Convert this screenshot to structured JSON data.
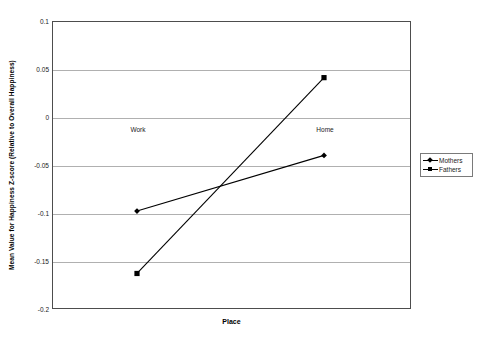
{
  "chart_data": {
    "type": "line",
    "title": "",
    "subtitle": "",
    "xlabel": "Place",
    "ylabel": "Mean Value for Happiness Z-score (Relative to Overall Happiness)",
    "categories": [
      "Work",
      "Home"
    ],
    "series": [
      {
        "name": "Mothers",
        "marker": "diamond",
        "values": [
          -0.098,
          -0.04
        ]
      },
      {
        "name": "Fathers",
        "marker": "square",
        "values": [
          -0.163,
          0.041
        ]
      }
    ],
    "ylim": [
      -0.2,
      0.1
    ],
    "yticks": [
      0.1,
      0.05,
      0,
      -0.05,
      -0.1,
      -0.15,
      -0.2
    ],
    "ytick_labels": [
      "0.1",
      "0.05",
      "0",
      "-0.05",
      "-0.1",
      "-0.15",
      "-0.2"
    ],
    "grid": true,
    "grid_axis": "y",
    "legend_position": "right",
    "line_color": "#000000",
    "grid_color": "#b0b0b0",
    "axis_color": "#4d4d4d",
    "background": "#ffffff"
  },
  "legend": {
    "entries": [
      {
        "label": "Mothers",
        "marker": "diamond"
      },
      {
        "label": "Fathers",
        "marker": "square"
      }
    ]
  },
  "axes": {
    "x_title": "Place",
    "y_title": "Mean Value for Happiness Z-score (Relative to Overall Happiness)",
    "category_labels": [
      "Work",
      "Home"
    ]
  }
}
